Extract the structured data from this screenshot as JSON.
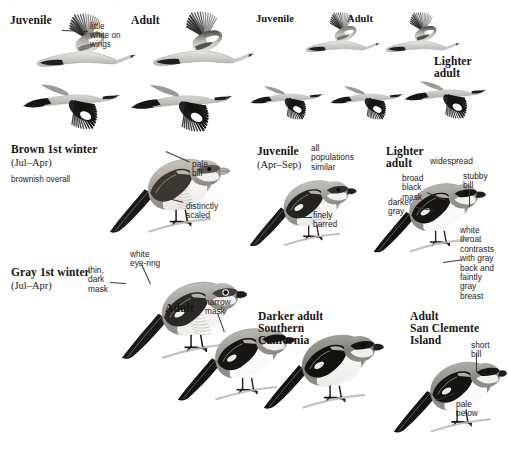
{
  "plate": {
    "background": "#ffffff",
    "ink": "#161412",
    "annotation_color": "#26221f",
    "leader_color": "#3a3734"
  },
  "top_cut_row": ". .            .                    .                         .",
  "flight_section": {
    "headers": [
      {
        "label": "Juvenile",
        "x": 10,
        "y": 14,
        "size": 11.5
      },
      {
        "label": "Adult",
        "x": 131,
        "y": 14,
        "size": 11.5
      },
      {
        "label": "Juvenile",
        "x": 256,
        "y": 13,
        "size": 10.5
      },
      {
        "label": "Adult",
        "x": 347,
        "y": 13,
        "size": 10.5
      },
      {
        "label": "Lighter\nadult",
        "x": 434,
        "y": 55,
        "size": 11.5
      }
    ],
    "annotations": [
      {
        "text": "little\nwhite on\nwings",
        "x": 90,
        "y": 22,
        "size": 8.2
      }
    ]
  },
  "mid_section": {
    "headers": [
      {
        "label": "Brown 1st winter",
        "x": 11,
        "y": 143,
        "size": 11.5
      },
      {
        "label": "Juvenile",
        "x": 257,
        "y": 145,
        "size": 11.5
      },
      {
        "label": "Lighter\nadult",
        "x": 386,
        "y": 145,
        "size": 11.5
      }
    ],
    "subs": [
      {
        "label": "(Jul–Apr)",
        "x": 11,
        "y": 157,
        "size": 10.5
      },
      {
        "label": "(Apr–Sep)",
        "x": 257,
        "y": 159,
        "size": 10.5
      }
    ],
    "annotations": [
      {
        "text": "brownish overall",
        "x": 11,
        "y": 175,
        "size": 8.2
      },
      {
        "text": "pale\nbill",
        "x": 192,
        "y": 160,
        "size": 8.4
      },
      {
        "text": "distinctly\nscaled",
        "x": 186,
        "y": 202,
        "size": 8.4
      },
      {
        "text": "all\npopulations\nsimilar",
        "x": 311,
        "y": 144,
        "size": 8.4
      },
      {
        "text": "finely\nbarred",
        "x": 313,
        "y": 211,
        "size": 8.4
      },
      {
        "text": "widespread",
        "x": 430,
        "y": 157,
        "size": 8.4
      },
      {
        "text": "broad\nblack\nmask",
        "x": 402,
        "y": 174,
        "size": 8.4
      },
      {
        "text": "stubby\nbill",
        "x": 463,
        "y": 172,
        "size": 8.4
      },
      {
        "text": "darker\ngray",
        "x": 388,
        "y": 198,
        "size": 8.4
      },
      {
        "text": "white\nthroat\ncontrasts\nwith gray\nback and\nfaintly\ngray breast",
        "x": 460,
        "y": 226,
        "size": 8.4
      }
    ]
  },
  "bottom_section": {
    "headers": [
      {
        "label": "Gray 1st winter",
        "x": 11,
        "y": 266,
        "size": 11.5
      },
      {
        "label": "Adult",
        "x": 165,
        "y": 302,
        "size": 11.5
      },
      {
        "label": "Darker adult\nSouthern\nCalifornia",
        "x": 258,
        "y": 310,
        "size": 11.5
      },
      {
        "label": "Adult\nSan Clemente\nIsland",
        "x": 410,
        "y": 310,
        "size": 11.5
      }
    ],
    "subs": [
      {
        "label": "(Jul–Apr)",
        "x": 11,
        "y": 280,
        "size": 10.5
      }
    ],
    "annotations": [
      {
        "text": "white\neye-ring",
        "x": 130,
        "y": 250,
        "size": 8.4
      },
      {
        "text": "thin,\ndark\nmask",
        "x": 88,
        "y": 266,
        "size": 8.4
      },
      {
        "text": "narrow\nmask",
        "x": 205,
        "y": 298,
        "size": 8.4
      },
      {
        "text": "short\nbill",
        "x": 471,
        "y": 341,
        "size": 8.4
      },
      {
        "text": "pale\nbelow",
        "x": 456,
        "y": 400,
        "size": 8.4
      }
    ]
  },
  "leaders": [
    {
      "name": "little-white-on-wings",
      "x": 62,
      "y": 30,
      "len": 26,
      "angle": 2
    },
    {
      "name": "pale-bill",
      "x": 166,
      "y": 151,
      "len": 26,
      "angle": 24
    },
    {
      "name": "distinctly-scaled",
      "x": 160,
      "y": 196,
      "len": 24,
      "angle": 14
    },
    {
      "name": "finely-barred",
      "x": 298,
      "y": 217,
      "len": 14,
      "angle": 0
    },
    {
      "name": "stubby-bill",
      "x": 470,
      "y": 189,
      "len": 18,
      "angle": 90
    },
    {
      "name": "broad-black-mask",
      "x": 427,
      "y": 192,
      "len": 20,
      "angle": 22
    },
    {
      "name": "darker-gray",
      "x": 416,
      "y": 207,
      "len": 18,
      "angle": 10
    },
    {
      "name": "white-throat",
      "x": 443,
      "y": 262,
      "len": 18,
      "angle": -8
    },
    {
      "name": "white-eye-ring",
      "x": 142,
      "y": 264,
      "len": 22,
      "angle": 66
    },
    {
      "name": "thin-dark-mask",
      "x": 110,
      "y": 282,
      "len": 16,
      "angle": 4
    },
    {
      "name": "narrow-mask",
      "x": 218,
      "y": 313,
      "len": 20,
      "angle": 70
    },
    {
      "name": "short-bill",
      "x": 477,
      "y": 354,
      "len": 18,
      "angle": 90
    },
    {
      "name": "pale-below",
      "x": 436,
      "y": 400,
      "len": 20,
      "angle": -20
    }
  ]
}
